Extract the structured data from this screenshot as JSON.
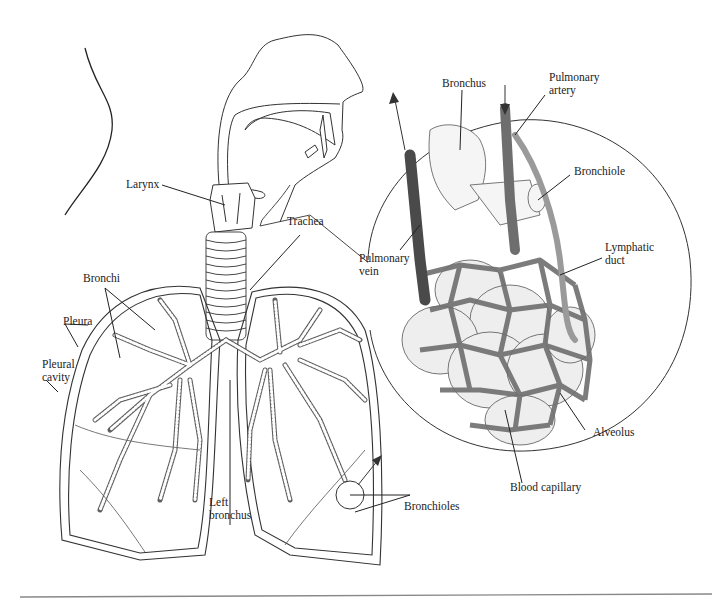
{
  "figure": {
    "labels": {
      "larynx": "Larynx",
      "trachea": "Trachea",
      "bronchi": "Bronchi",
      "pleura": "Pleura",
      "pleural_cavity": "Pleural\ncavity",
      "left_bronchus": "Left\nbronchus",
      "bronchioles": "Bronchioles",
      "bronchus": "Bronchus",
      "pulmonary_artery": "Pulmonary\nartery",
      "bronchiole": "Bronchiole",
      "pulmonary_vein": "Pulmonary\nvein",
      "lymphatic_duct": "Lymphatic\nduct",
      "alveolus": "Alveolus",
      "blood_capillary": "Blood capillary"
    },
    "colors": {
      "line": "#222222",
      "vein": "#555555",
      "artery": "#7a7a7a",
      "capillary": "#6e6e6e",
      "lymph": "#9a9a9a",
      "alveolus_fill": "#eeeeee",
      "rule": "#888888"
    }
  }
}
